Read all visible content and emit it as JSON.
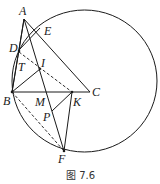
{
  "figure": {
    "caption": "图 7.6",
    "stroke_color": "#1a1a1a",
    "points": {
      "A": {
        "label": "A"
      },
      "E": {
        "label": "E"
      },
      "D": {
        "label": "D"
      },
      "T": {
        "label": "T"
      },
      "I": {
        "label": "I"
      },
      "B": {
        "label": "B"
      },
      "M": {
        "label": "M"
      },
      "K": {
        "label": "K"
      },
      "C": {
        "label": "C"
      },
      "P": {
        "label": "P"
      },
      "F": {
        "label": "F"
      }
    }
  }
}
